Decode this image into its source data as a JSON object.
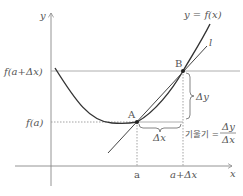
{
  "diagram": {
    "axes": {
      "x_label": "x",
      "y_label": "y"
    },
    "curve_label": "y = f(x)",
    "line_label": "l",
    "points": [
      {
        "name": "A",
        "label": "A"
      },
      {
        "name": "B",
        "label": "B"
      }
    ],
    "y_ticks": {
      "upper": "f(a+Δx)",
      "lower": "f(a)"
    },
    "x_ticks": {
      "left": "a",
      "right": "a+Δx"
    },
    "delta_x": "Δx",
    "delta_y": "Δy",
    "slope": {
      "prefix": "기울기 =",
      "numerator": "Δy",
      "denominator": "Δx"
    },
    "colors": {
      "curve": "#333333",
      "axis": "#888888",
      "guide": "#999999",
      "text": "#555555"
    }
  }
}
